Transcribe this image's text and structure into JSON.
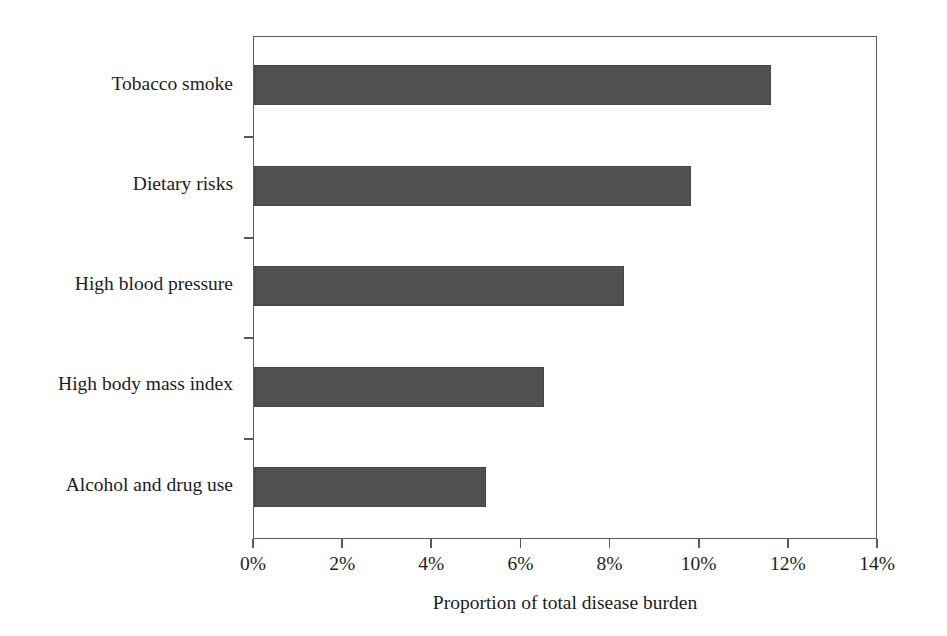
{
  "chart_data": {
    "type": "bar",
    "orientation": "horizontal",
    "title": "",
    "xlabel": "Proportion of total disease burden",
    "ylabel": "",
    "categories": [
      "Tobacco smoke",
      "Dietary risks",
      "High blood pressure",
      "High body mass index",
      "Alcohol and drug use"
    ],
    "values": [
      11.6,
      9.8,
      8.3,
      6.5,
      5.2
    ],
    "value_unit": "%",
    "xlim": [
      0,
      14
    ],
    "xticks": [
      0,
      2,
      4,
      6,
      8,
      10,
      12,
      14
    ],
    "xticklabels": [
      "0%",
      "2%",
      "4%",
      "6%",
      "8%",
      "10%",
      "12%",
      "14%"
    ],
    "grid": false,
    "legend": false,
    "bar_color": "#474747",
    "axis_color": "#5a5a5a",
    "text_color": "#1c1c1c",
    "background_color": "#ffffff"
  }
}
